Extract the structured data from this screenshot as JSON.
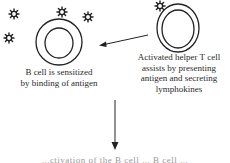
{
  "diagram": {
    "b_cell": {
      "label_line1": "B cell is sensitized",
      "label_line2": "by binding of antigen"
    },
    "t_cell": {
      "label_line1": "Activated helper T cell",
      "label_line2": "assists by presenting",
      "label_line3": "antigen and secreting",
      "label_line4": "lymphokines"
    },
    "bottom_text": "...ctivation of the B cell ... B cell ...",
    "icons": [
      "antigen-icon",
      "b-cell-icon",
      "t-cell-icon",
      "arrow-left-icon",
      "arrow-down-icon"
    ],
    "colors": {
      "stroke": "#222222",
      "text": "#2a2a2a",
      "background": "#ffffff"
    }
  }
}
